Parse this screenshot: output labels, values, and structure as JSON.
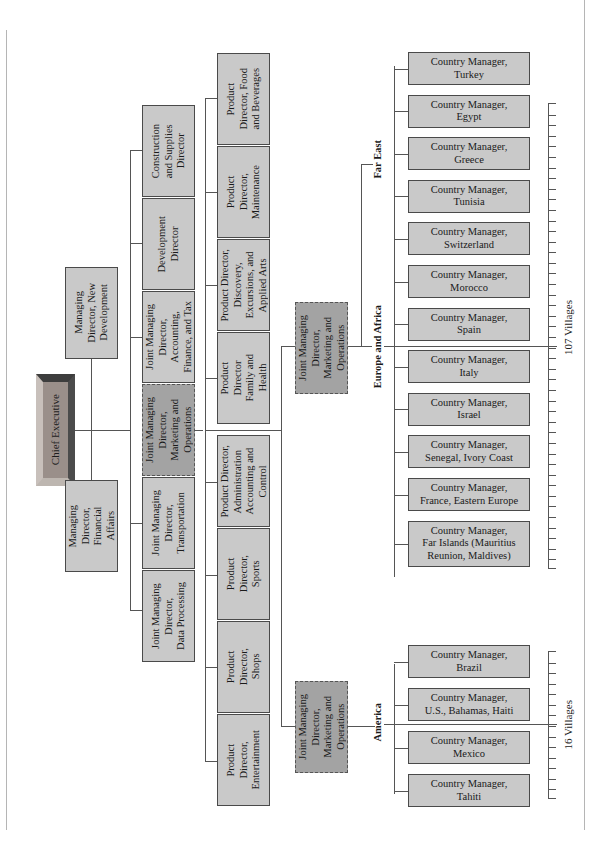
{
  "diagram": {
    "type": "organization-chart",
    "orientation": "rotated-90-ccw",
    "ceo": "Chief Executive",
    "managing_directors": [
      {
        "label": "Managing\nDirector,\nFinancial\nAffairs"
      },
      {
        "label": "Managing\nDirector, New\nDevelopment"
      }
    ],
    "second_row": [
      {
        "label": "Joint Managing\nDirector,\nData Processing"
      },
      {
        "label": "Joint Managing\nDirector,\nTransportation"
      },
      {
        "label": "Joint Managing\nDirector,\nMarketing and\nOperations",
        "highlight": true
      },
      {
        "label": "Joint Managing\nDirector,\nAccounting,\nFinance, and Tax"
      },
      {
        "label": "Development\nDirector"
      },
      {
        "label": "Construction\nand Supplies\nDirector"
      }
    ],
    "product_directors": [
      {
        "label": "Product\nDirector,\nEntertainment"
      },
      {
        "label": "Product\nDirector,\nShops"
      },
      {
        "label": "Product\nDirector,\nSports"
      },
      {
        "label": "Product Director,\nAdministration\nAccounting and\nControl"
      },
      {
        "label": "Product\nDirector\nFamily and\nHealth"
      },
      {
        "label": "Product Director,\nDiscovery,\nExcursions, and\nApplied Arts"
      },
      {
        "label": "Product\nDirector,\nMaintenance"
      },
      {
        "label": "Product\nDirector, Food\nand Beverages"
      }
    ],
    "regional_jmds": [
      {
        "label": "Joint Managing\nDirector,\nMarketing and\nOperations",
        "region": "Europe and Africa"
      },
      {
        "label": "Joint Managing\nDirector,\nMarketing and\nOperations",
        "region": "America"
      }
    ],
    "regions": {
      "far_east": "Far East",
      "europe_africa": "Europe and Africa",
      "america": "America"
    },
    "country_managers_europe": [
      "Country Manager,\nTurkey",
      "Country Manager,\nEgypt",
      "Country Manager,\nGreece",
      "Country Manager,\nTunisia",
      "Country Manager,\nSwitzerland",
      "Country Manager,\nMorocco",
      "Country Manager,\nSpain",
      "Country Manager,\nItaly",
      "Country Manager,\nIsrael",
      "Country Manager,\nSenegal, Ivory Coast",
      "Country Manager,\nFrance, Eastern Europe",
      "Country Manager,\nFar Islands (Mauritius\nReunion, Maldives)"
    ],
    "country_managers_america": [
      "Country Manager,\nBrazil",
      "Country Manager,\nU.S., Bahamas, Haiti",
      "Country Manager,\nMexico",
      "Country Manager,\nTahiti"
    ],
    "village_counts": {
      "europe_africa": "107 Villages",
      "america": "16 Villages"
    }
  },
  "colors": {
    "box_fill": "#c9c9c9",
    "highlight_fill": "#a3a3a3",
    "line": "#555555"
  }
}
